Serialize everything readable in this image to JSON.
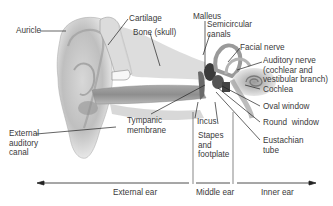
{
  "diagram": {
    "labels": {
      "auricle": "Auricle",
      "cartilage": "Cartilage",
      "malleus": "Malleus",
      "semicircular_canals": "Semicircular\ncanals",
      "bone_skull": "Bone (skull)",
      "facial_nerve": "Facial nerve",
      "auditory_nerve": "Auditory nerve\n(cochlear and\nvestibular branch)",
      "cochlea": "Cochlea",
      "oval_window": "Oval window",
      "round_window": "Round  window",
      "eustachian_tube": "Eustachian\ntube",
      "external_auditory_canal": "External\nauditory\ncanal",
      "tympanic_membrane": "Tympanic\nmembrane",
      "incus": "Incus",
      "stapes_footplate": "Stapes\nand\nfootplate"
    },
    "regions": [
      {
        "label": "External ear"
      },
      {
        "label": "Middle ear"
      },
      {
        "label": "Inner ear"
      }
    ]
  }
}
